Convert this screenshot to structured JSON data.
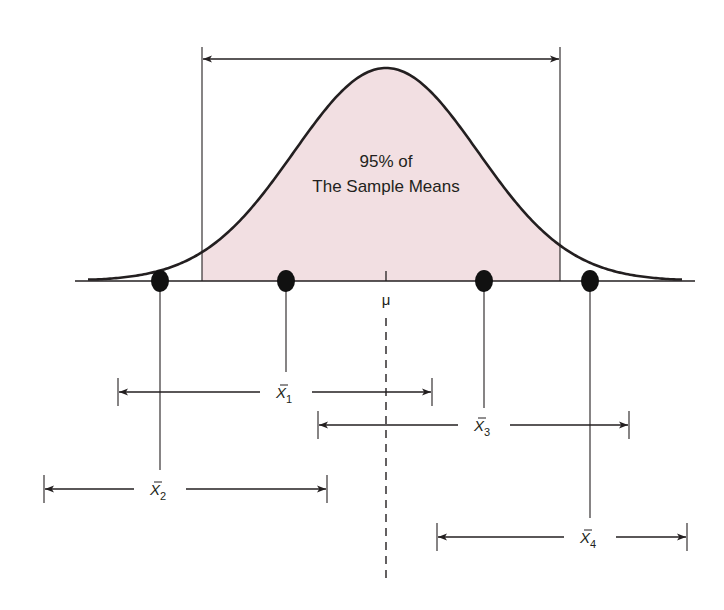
{
  "figure": {
    "shaded_label_line1": "95% of",
    "shaded_label_line2": "The Sample Means",
    "mean_symbol": "μ",
    "colors": {
      "background": "#ffffff",
      "shaded_region": "#f2dfe2",
      "ink": "#231f20"
    },
    "geometry": {
      "baseline_y": 281,
      "baseline_x": [
        75,
        695
      ],
      "mean_x": 386,
      "peak_y": 68,
      "sigma_px": 92,
      "tail_x": [
        88,
        683
      ],
      "shade_bounds_x": [
        202,
        560
      ],
      "top_arrow_y": 59,
      "boundary_top_y": 47,
      "dashed_line_y": [
        318,
        582
      ]
    },
    "samples": [
      {
        "name": "x̄1",
        "symbol": "X",
        "subscript": "1",
        "point_x": 286,
        "interval": [
          118,
          432
        ],
        "interval_y": 392,
        "stem_bottom_y": 372
      },
      {
        "name": "x̄2",
        "symbol": "X",
        "subscript": "2",
        "point_x": 160,
        "interval": [
          44,
          327
        ],
        "interval_y": 489,
        "stem_bottom_y": 470
      },
      {
        "name": "x̄3",
        "symbol": "X",
        "subscript": "3",
        "point_x": 484,
        "interval": [
          318,
          629
        ],
        "interval_y": 425,
        "stem_bottom_y": 408
      },
      {
        "name": "x̄4",
        "symbol": "X",
        "subscript": "4",
        "point_x": 590,
        "interval": [
          437,
          687
        ],
        "interval_y": 537,
        "stem_bottom_y": 518
      }
    ]
  }
}
